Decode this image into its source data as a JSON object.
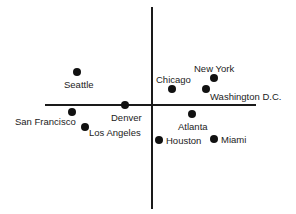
{
  "chart_data": {
    "type": "scatter",
    "title": "",
    "xlabel": "",
    "ylabel": "",
    "grid": false,
    "legend": "none",
    "axes": {
      "horizontal": {
        "x1": 45,
        "x2": 256,
        "y": 105
      },
      "vertical": {
        "x": 152,
        "y1": 7,
        "y2": 209
      }
    },
    "points": [
      {
        "name": "Seattle",
        "x": 77,
        "y": 72,
        "lx": 64,
        "ly": 80
      },
      {
        "name": "Denver",
        "x": 125,
        "y": 105,
        "lx": 111,
        "ly": 113
      },
      {
        "name": "San Francisco",
        "x": 72,
        "y": 112,
        "lx": 15,
        "ly": 117
      },
      {
        "name": "Los Angeles",
        "x": 85,
        "y": 127,
        "lx": 89,
        "ly": 128
      },
      {
        "name": "Chicago",
        "x": 172,
        "y": 89,
        "lx": 156,
        "ly": 75
      },
      {
        "name": "New York",
        "x": 214,
        "y": 78,
        "lx": 194,
        "ly": 64
      },
      {
        "name": "Washington D.C.",
        "x": 206,
        "y": 89,
        "lx": 210,
        "ly": 92
      },
      {
        "name": "Atlanta",
        "x": 192,
        "y": 114,
        "lx": 178,
        "ly": 122
      },
      {
        "name": "Houston",
        "x": 159,
        "y": 140,
        "lx": 166,
        "ly": 136
      },
      {
        "name": "Miami",
        "x": 214,
        "y": 139,
        "lx": 221,
        "ly": 135
      }
    ]
  }
}
